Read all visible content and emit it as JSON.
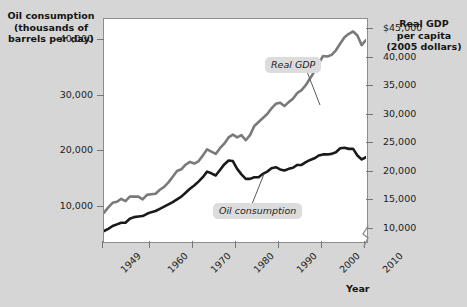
{
  "figure": {
    "background_color": "#d6d6d6",
    "plot_background_color": "#ffffff"
  },
  "left_axis": {
    "title": "Oil consumption\n(thousands of\nbarrels per day)",
    "ticks": [
      "40,000",
      "30,000",
      "20,000",
      "10,000"
    ],
    "tick_values": [
      40000,
      30000,
      20000,
      10000
    ]
  },
  "right_axis": {
    "title": "Real GDP\nper capita\n(2005 dollars)",
    "ticks": [
      "$45,000",
      "40,000",
      "35,000",
      "30,000",
      "25,000",
      "20,000",
      "15,000",
      "10,000"
    ],
    "tick_values": [
      45000,
      40000,
      35000,
      30000,
      25000,
      20000,
      15000,
      10000
    ],
    "has_axis_break": true
  },
  "x_axis": {
    "label": "Year",
    "ticks": [
      "1949",
      "1960",
      "1970",
      "1980",
      "1990",
      "2000",
      "2010"
    ],
    "tick_values": [
      1949,
      1960,
      1970,
      1980,
      1990,
      2000,
      2010
    ]
  },
  "annotations": {
    "real_gdp": "Real GDP",
    "oil_consumption": "Oil consumption"
  },
  "colors": {
    "oil_line": "#1a1a1a",
    "gdp_line": "#7a7a7a",
    "frame": "#8d8d8d",
    "annotation_bg": "#dcdcdc"
  },
  "chart_data": {
    "type": "line",
    "title": "",
    "xlabel": "Year",
    "ylabel": "Oil consumption (thousands of barrels per day)",
    "y2label": "Real GDP per capita (2005 dollars)",
    "xlim": [
      1949,
      2010
    ],
    "ylim": [
      4000,
      44000
    ],
    "y2lim": [
      8000,
      47000
    ],
    "grid": false,
    "legend_position": "inline-annotations",
    "x": [
      1949,
      1950,
      1951,
      1952,
      1953,
      1954,
      1955,
      1956,
      1957,
      1958,
      1959,
      1960,
      1961,
      1962,
      1963,
      1964,
      1965,
      1966,
      1967,
      1968,
      1969,
      1970,
      1971,
      1972,
      1973,
      1974,
      1975,
      1976,
      1977,
      1978,
      1979,
      1980,
      1981,
      1982,
      1983,
      1984,
      1985,
      1986,
      1987,
      1988,
      1989,
      1990,
      1991,
      1992,
      1993,
      1994,
      1995,
      1996,
      1997,
      1998,
      1999,
      2000,
      2001,
      2002,
      2003,
      2004,
      2005,
      2006,
      2007,
      2008,
      2009,
      2010
    ],
    "series": [
      {
        "name": "Oil consumption",
        "axis": "left",
        "unit": "thousands of barrels per day",
        "color": "#1a1a1a",
        "values": [
          5800,
          6200,
          6700,
          7000,
          7300,
          7300,
          8000,
          8300,
          8400,
          8500,
          8900,
          9200,
          9400,
          9800,
          10200,
          10600,
          11000,
          11500,
          12000,
          12700,
          13400,
          14000,
          14700,
          15500,
          16500,
          16200,
          15800,
          16800,
          17800,
          18500,
          18400,
          17000,
          16000,
          15200,
          15200,
          15500,
          15500,
          16100,
          16500,
          17100,
          17300,
          16900,
          16700,
          17000,
          17200,
          17700,
          17700,
          18200,
          18600,
          18900,
          19400,
          19600,
          19600,
          19700,
          20000,
          20700,
          20800,
          20600,
          20600,
          19400,
          18700,
          19100
        ]
      },
      {
        "name": "Real GDP",
        "axis": "right",
        "unit": "2005 dollars per capita",
        "color": "#7a7a7a",
        "values": [
          13000,
          13900,
          14700,
          14900,
          15400,
          15000,
          15800,
          15800,
          15800,
          15300,
          16100,
          16200,
          16300,
          17000,
          17500,
          18300,
          19300,
          20300,
          20600,
          21400,
          21900,
          21600,
          22000,
          23000,
          24100,
          23700,
          23300,
          24300,
          25100,
          26200,
          26700,
          26200,
          26600,
          25700,
          26600,
          28200,
          28900,
          29600,
          30300,
          31300,
          32100,
          32300,
          31700,
          32400,
          33000,
          34000,
          34500,
          35400,
          36600,
          37800,
          39200,
          40500,
          40400,
          40700,
          41500,
          42700,
          43800,
          44400,
          44800,
          44100,
          42400,
          43300
        ]
      }
    ]
  }
}
